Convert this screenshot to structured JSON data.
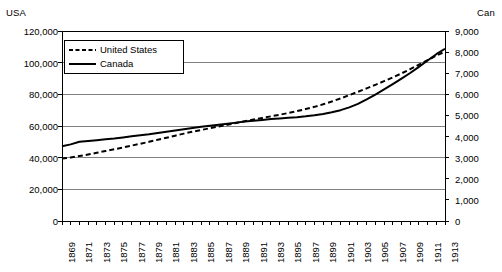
{
  "chart_data": {
    "type": "line",
    "title": "",
    "xlabel": "",
    "left_axis_title": "USA",
    "right_axis_title": "Can",
    "grid": true,
    "legend_position": "top-left-inside",
    "x": [
      1869,
      1870,
      1871,
      1872,
      1873,
      1874,
      1875,
      1876,
      1877,
      1878,
      1879,
      1880,
      1881,
      1882,
      1883,
      1884,
      1885,
      1886,
      1887,
      1888,
      1889,
      1890,
      1891,
      1892,
      1893,
      1894,
      1895,
      1896,
      1897,
      1898,
      1899,
      1900,
      1901,
      1902,
      1903,
      1904,
      1905,
      1906,
      1907,
      1908,
      1909,
      1910,
      1911,
      1912,
      1913
    ],
    "xtick_labels": [
      "1869",
      "1871",
      "1873",
      "1875",
      "1877",
      "1879",
      "1881",
      "1883",
      "1885",
      "1887",
      "1889",
      "1891",
      "1893",
      "1895",
      "1897",
      "1899",
      "1901",
      "1903",
      "1905",
      "1907",
      "1909",
      "1911",
      "1913"
    ],
    "left_axis": {
      "ticks": [
        0,
        20000,
        40000,
        60000,
        80000,
        100000,
        120000
      ],
      "tick_labels": [
        "0",
        "20,000",
        "40,000",
        "60,000",
        "80,000",
        "100,000",
        "120,000"
      ],
      "ylim": [
        0,
        120000
      ]
    },
    "right_axis": {
      "ticks": [
        0,
        1000,
        2000,
        3000,
        4000,
        5000,
        6000,
        7000,
        8000,
        9000
      ],
      "tick_labels": [
        "0",
        "1,000",
        "2,000",
        "3,000",
        "4,000",
        "5,000",
        "6,000",
        "7,000",
        "8,000",
        "9,000"
      ],
      "ylim": [
        0,
        9000
      ]
    },
    "series": [
      {
        "name": "United States",
        "axis": "left",
        "style": "dashed",
        "color": "#000000",
        "values": [
          39500,
          40100,
          41000,
          42000,
          43100,
          44200,
          45300,
          46400,
          47600,
          48800,
          50000,
          51300,
          52600,
          53900,
          55200,
          56400,
          57500,
          58600,
          59700,
          60800,
          61900,
          63000,
          64100,
          65100,
          66100,
          67100,
          68200,
          69400,
          70700,
          72100,
          73700,
          75500,
          77400,
          79500,
          81600,
          83800,
          86000,
          88300,
          90700,
          93200,
          95900,
          98700,
          101600,
          104400,
          107000
        ]
      },
      {
        "name": "Canada",
        "axis": "right",
        "style": "solid",
        "color": "#000000",
        "values": [
          3540,
          3630,
          3750,
          3790,
          3830,
          3870,
          3910,
          3960,
          4010,
          4060,
          4110,
          4170,
          4230,
          4290,
          4350,
          4410,
          4460,
          4510,
          4560,
          4610,
          4660,
          4710,
          4750,
          4790,
          4830,
          4860,
          4890,
          4920,
          4960,
          5010,
          5070,
          5150,
          5250,
          5380,
          5550,
          5760,
          5990,
          6230,
          6480,
          6740,
          7010,
          7300,
          7600,
          7900,
          8160
        ]
      }
    ]
  },
  "legend": {
    "items": [
      {
        "label": "United States",
        "style": "dashed"
      },
      {
        "label": "Canada",
        "style": "solid"
      }
    ]
  }
}
